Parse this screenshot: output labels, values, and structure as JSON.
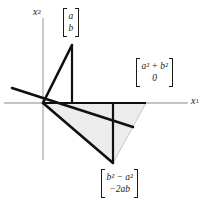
{
  "figure": {
    "axes": {
      "x_label": "x",
      "x_label_sub": "1",
      "y_label": "x",
      "y_label_sub": "2",
      "axis_color": "#b0b0b0",
      "origin": {
        "x": 43,
        "y": 103
      }
    },
    "stroke_color": "#101010",
    "fill_color": "#ececec",
    "labels": {
      "input_vector": {
        "row1": "a",
        "row2": "b"
      },
      "rotated_vector": {
        "row1": "a² + b²",
        "row2": "0"
      },
      "reflected_vector": {
        "row1": "b² − a²",
        "row2": "−2ab"
      }
    }
  }
}
